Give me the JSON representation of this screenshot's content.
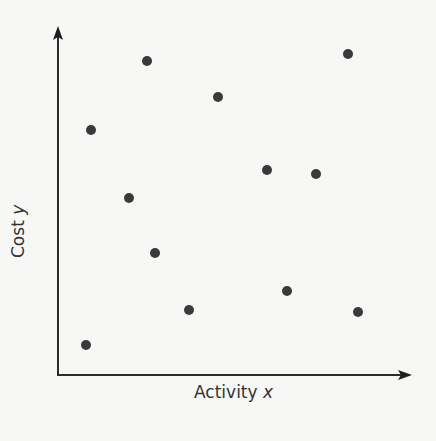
{
  "chart_data": {
    "type": "scatter",
    "title": "",
    "xlabel": "Activity",
    "xlabel_var": "x",
    "ylabel": "Cost",
    "ylabel_var": "y",
    "grid": false,
    "legend": null,
    "ticks": "none",
    "units": "unitless plot coordinates (pixels from origin; no tick labels shown)",
    "xlim": [
      0,
      352
    ],
    "ylim": [
      0,
      347
    ],
    "points": [
      {
        "x": 33,
        "y": 245
      },
      {
        "x": 89,
        "y": 314
      },
      {
        "x": 160,
        "y": 278
      },
      {
        "x": 290,
        "y": 321
      },
      {
        "x": 71,
        "y": 177
      },
      {
        "x": 209,
        "y": 205
      },
      {
        "x": 258,
        "y": 201
      },
      {
        "x": 97,
        "y": 122
      },
      {
        "x": 229,
        "y": 84
      },
      {
        "x": 131,
        "y": 65
      },
      {
        "x": 300,
        "y": 63
      },
      {
        "x": 28,
        "y": 30
      }
    ],
    "style": {
      "point_color": "#3a3a3a",
      "point_radius": 5,
      "axis_color": "#2b2b2b",
      "background": "#f7f7f5"
    }
  },
  "layout": {
    "origin_px": {
      "x": 58,
      "y": 375
    },
    "x_axis_end_px": 412,
    "y_axis_end_px": 26
  },
  "labels": {
    "x_axis_text": "Activity ",
    "x_axis_var": "x",
    "y_axis_text": "Cost ",
    "y_axis_var": "y"
  }
}
